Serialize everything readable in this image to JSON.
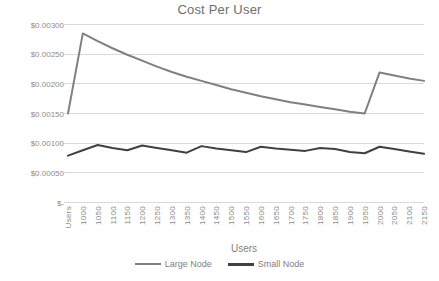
{
  "chart_data": {
    "type": "line",
    "title": "Cost Per User",
    "xlabel": "Users",
    "ylabel": "",
    "grid": true,
    "legend_position": "bottom",
    "ylim": [
      0,
      0.003
    ],
    "ytick_values": [
      0.003,
      0.0025,
      0.002,
      0.0015,
      0.001,
      0.0005,
      0
    ],
    "ytick_labels": [
      "$0.00300",
      "$0.00250",
      "$0.00200",
      "$0.00150",
      "$0.00100",
      "$0.00050",
      "$-"
    ],
    "categories": [
      "Users",
      "1000",
      "1050",
      "1100",
      "1150",
      "1200",
      "1250",
      "1300",
      "1350",
      "1400",
      "1450",
      "1500",
      "1550",
      "1600",
      "1650",
      "1700",
      "1750",
      "1800",
      "1850",
      "1900",
      "1950",
      "2000",
      "2050",
      "2100",
      "2150"
    ],
    "series": [
      {
        "name": "Large Node",
        "color": "#808080",
        "values": [
          0.0015,
          0.00285,
          0.00272,
          0.0026,
          0.00249,
          0.00239,
          0.00229,
          0.0022,
          0.00212,
          0.00205,
          0.00198,
          0.00191,
          0.00185,
          0.00179,
          0.00174,
          0.00169,
          0.00165,
          0.00161,
          0.00157,
          0.00153,
          0.0015,
          0.00219,
          0.00214,
          0.00209,
          0.00205
        ]
      },
      {
        "name": "Small Node",
        "color": "#404040",
        "values": [
          0.00079,
          0.00088,
          0.00097,
          0.00092,
          0.00088,
          0.00096,
          0.00092,
          0.00088,
          0.00084,
          0.00095,
          0.00091,
          0.00088,
          0.00085,
          0.00094,
          0.00091,
          0.00089,
          0.00087,
          0.00092,
          0.0009,
          0.00085,
          0.00083,
          0.00094,
          0.0009,
          0.00086,
          0.00082
        ]
      }
    ]
  },
  "legend": {
    "items": [
      {
        "label": "Large Node"
      },
      {
        "label": "Small Node"
      }
    ]
  },
  "colors": {
    "large_node": "#808080",
    "small_node": "#404040",
    "gridline": "#d9d9d9",
    "text": "#7f7f7f",
    "background": "#ffffff"
  }
}
